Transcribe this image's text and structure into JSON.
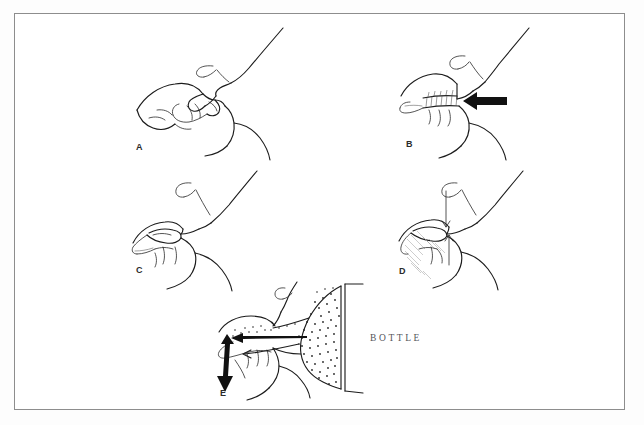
{
  "figure": {
    "background_color": "#fdfdfd",
    "frame_color": "#8d8d8d",
    "ink_color": "#1c1c1c",
    "caption_color": "#55555a"
  },
  "panels": [
    {
      "id": "A",
      "label": "A",
      "label_x": 135,
      "label_y": 142,
      "caption": "",
      "description": "Infant head in sagittal profile with nipple drawn into the mouth; lips sealed on areola.",
      "origin_x": 130,
      "origin_y": 25
    },
    {
      "id": "B",
      "label": "B",
      "label_x": 405,
      "label_y": 139,
      "caption": "",
      "description": "Tongue and hard palate compress the nipple; bold horizontal arrow shows compression direction.",
      "origin_x": 398,
      "origin_y": 25
    },
    {
      "id": "C",
      "label": "C",
      "label_x": 135,
      "label_y": 265,
      "caption": "",
      "description": "Nipple elongated within the oral cavity as the tongue moves posteriorly.",
      "origin_x": 130,
      "origin_y": 168
    },
    {
      "id": "D",
      "label": "D",
      "label_x": 398,
      "label_y": 266,
      "caption": "",
      "description": "Negative pressure phase; thin vertical arrows and shading mark the lowered tongue and jaw.",
      "origin_x": 395,
      "origin_y": 168
    },
    {
      "id": "E",
      "label": "E",
      "label_x": 219,
      "label_y": 388,
      "caption": "BOTTLE",
      "caption_x": 368,
      "caption_y": 331,
      "description": "Bottle teat (stippled) fills the mouth; long arrow shows flow direction, double-headed arrow shows jaw excursion.",
      "origin_x": 210,
      "origin_y": 272
    }
  ],
  "annotations": {
    "bottle_label": "BOTTLE",
    "arrow_b_direction": "left",
    "arrow_e_flow_direction": "left",
    "arrow_e_jaw": "double-headed vertical"
  }
}
